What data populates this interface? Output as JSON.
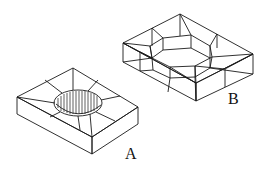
{
  "figure": {
    "labels": {
      "a": "A",
      "b": "B"
    },
    "colors": {
      "line": "#1a1a1a",
      "background": "#ffffff"
    }
  }
}
